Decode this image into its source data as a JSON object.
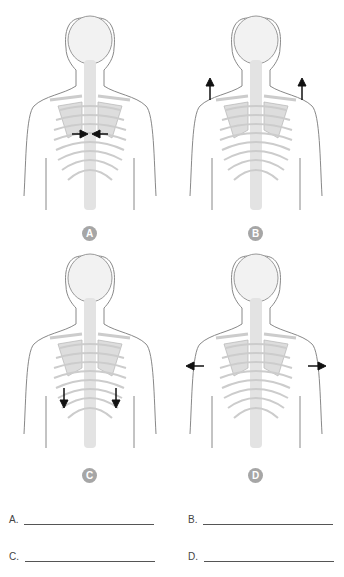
{
  "figures": [
    {
      "label": "A",
      "motion": "arrows-inward-between-scapulae"
    },
    {
      "label": "B",
      "motion": "arrows-upward-shoulders"
    },
    {
      "label": "C",
      "motion": "arrows-downward-scapulae"
    },
    {
      "label": "D",
      "motion": "arrows-outward-shoulders"
    }
  ],
  "answers": [
    {
      "label": "A."
    },
    {
      "label": "B."
    },
    {
      "label": "C."
    },
    {
      "label": "D."
    }
  ],
  "colors": {
    "badge": "#a6a6a6",
    "outline": "#777777",
    "bone": "#d9d9d9",
    "arrow": "#111111"
  }
}
